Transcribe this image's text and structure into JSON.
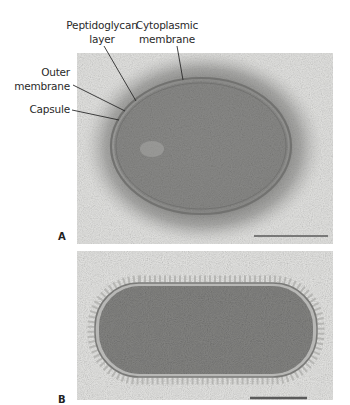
{
  "figure": {
    "labels": {
      "peptidoglycan": [
        "Peptidoglycan",
        "layer"
      ],
      "cytoplasmic": [
        "Cytoplasmic",
        "membrane"
      ],
      "outer": [
        "Outer",
        "membrane"
      ],
      "capsule": "Capsule"
    },
    "panels": [
      {
        "letter": "A",
        "description": "Electron micrograph of an oval bacterial cell surrounded by a thick capsule, with outer membrane, peptidoglycan layer and cytoplasmic membrane labeled"
      },
      {
        "letter": "B",
        "description": "Electron micrograph of a rod-shaped bacterial cell with thin envelope and sparse surface fibres"
      }
    ],
    "colors": {
      "background": "#e6e6e4",
      "cytoplasm": "#8a8a88",
      "capsule_halo": "#9a9a98",
      "membrane": "#6e6e6c",
      "leader_line": "#2a2a2a",
      "scale_bar": "#5a5a5a"
    }
  }
}
